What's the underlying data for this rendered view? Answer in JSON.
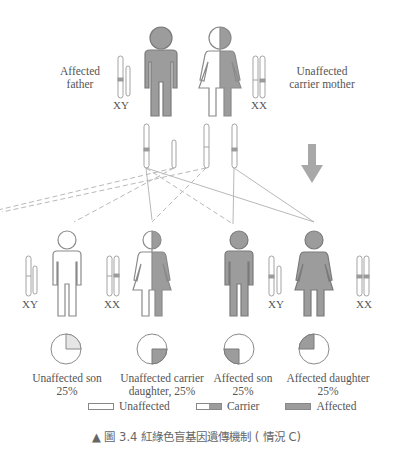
{
  "colors": {
    "affected": "#9c9c9c",
    "unaffected": "#ffffff",
    "outline": "#8a8a8a",
    "line": "#aaaaaa",
    "arrow": "#a8a8a8",
    "text": "#555555"
  },
  "parents": {
    "father": {
      "label_line1": "Affected",
      "label_line2": "father",
      "genotype": "XY",
      "status": "affected"
    },
    "mother": {
      "label_line1": "Unaffected",
      "label_line2": "carrier mother",
      "genotype": "XX",
      "status": "carrier"
    }
  },
  "children": [
    {
      "label_line1": "Unaffected son",
      "label_line2": "25%",
      "genotype": "XY",
      "status": "unaffected",
      "pie_quadrant": "top-right"
    },
    {
      "label_line1": "Unaffected carrier",
      "label_line2": "daughter, 25%",
      "genotype": "XX",
      "status": "carrier",
      "pie_quadrant": "bottom-right"
    },
    {
      "label_line1": "Affected son",
      "label_line2": "25%",
      "genotype": "XY",
      "status": "affected",
      "pie_quadrant": "bottom-left"
    },
    {
      "label_line1": "Affected daughter",
      "label_line2": "25%",
      "genotype": "XX",
      "status": "affected",
      "pie_quadrant": "top-left"
    }
  ],
  "legend": [
    {
      "label": "Unaffected",
      "type": "unaffected"
    },
    {
      "label": "Carrier",
      "type": "carrier"
    },
    {
      "label": "Affected",
      "type": "affected"
    }
  ],
  "caption": "▲ 圖 3.4 紅綠色盲基因遺傳機制 ( 情況 C)"
}
